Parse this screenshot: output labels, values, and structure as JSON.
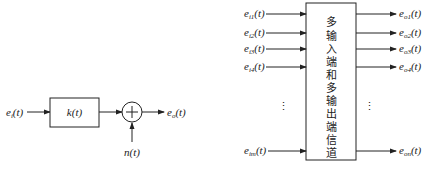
{
  "left_diagram": {
    "input_label": "e",
    "input_sub": "i",
    "block_label": "k(t)",
    "sum_symbol": "+",
    "noise_label": "n(t)",
    "output_label": "e",
    "output_sub": "o",
    "t_suffix": "(t)"
  },
  "right_diagram": {
    "block_text": [
      "多",
      "输",
      "入",
      "端",
      "和",
      "多",
      "输",
      "出",
      "端",
      "信",
      "道"
    ],
    "inputs": [
      {
        "base": "e",
        "sub": "i1",
        "suffix": "(t)"
      },
      {
        "base": "e",
        "sub": "i2",
        "suffix": "(t)"
      },
      {
        "base": "e",
        "sub": "i3",
        "suffix": "(t)"
      },
      {
        "base": "e",
        "sub": "i4",
        "suffix": "(t)"
      },
      {
        "base": "e",
        "sub": "im",
        "suffix": "(t)"
      }
    ],
    "outputs": [
      {
        "base": "e",
        "sub": "o1",
        "suffix": "(t)"
      },
      {
        "base": "e",
        "sub": "o2",
        "suffix": "(t)"
      },
      {
        "base": "e",
        "sub": "o3",
        "suffix": "(t)"
      },
      {
        "base": "e",
        "sub": "o4",
        "suffix": "(t)"
      },
      {
        "base": "e",
        "sub": "on",
        "suffix": "(t)"
      }
    ],
    "ellipsis": "⋮"
  }
}
